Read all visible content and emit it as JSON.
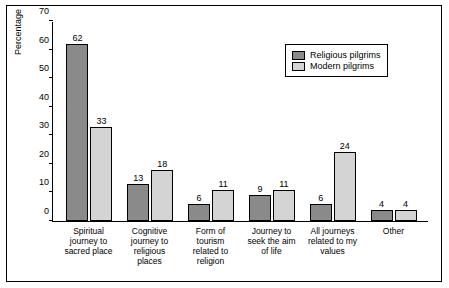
{
  "chart_data": {
    "type": "bar",
    "title": "",
    "xlabel": "",
    "ylabel": "Percentage",
    "ylim": [
      0,
      70
    ],
    "yticks": [
      0,
      10,
      20,
      30,
      40,
      50,
      60,
      70
    ],
    "grid": false,
    "legend_position": "top-right",
    "categories": [
      "Spiritual journey to sacred place",
      "Cognitive journey to religious places",
      "Form of tourism related to religion",
      "Journey to seek the aim of life",
      "All journeys related to my values",
      "Other"
    ],
    "category_lines": [
      [
        "Spiritual",
        "journey to",
        "sacred place"
      ],
      [
        "Cognitive",
        "journey to",
        "religious",
        "places"
      ],
      [
        "Form of",
        "tourism",
        "related to",
        "religion"
      ],
      [
        "Journey to",
        "seek the aim",
        "of life"
      ],
      [
        "All journeys",
        "related to my",
        "values"
      ],
      [
        "Other"
      ]
    ],
    "series": [
      {
        "name": "Religious pilgrims",
        "color": "#8a8a8a",
        "values": [
          62,
          13,
          6,
          9,
          6,
          4
        ]
      },
      {
        "name": "Modern pilgrims",
        "color": "#d4d4d4",
        "values": [
          33,
          18,
          11,
          11,
          24,
          4
        ]
      }
    ]
  },
  "legend": {
    "items": [
      {
        "label": "Religious pilgrims"
      },
      {
        "label": "Modern pilgrims"
      }
    ]
  }
}
